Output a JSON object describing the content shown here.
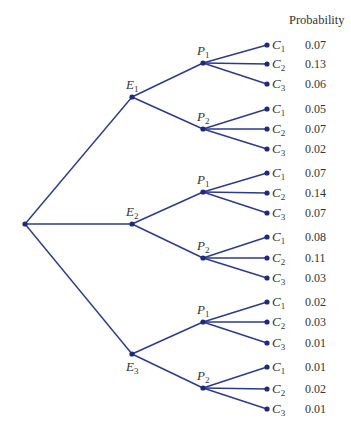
{
  "header": {
    "probability_label": "Probability"
  },
  "colors": {
    "edge": "#2b3a8c",
    "node": "#1f2a7a",
    "text": "#333333"
  },
  "tree": {
    "root": {
      "x": 25,
      "y": 224
    },
    "branches": [
      {
        "label": "E",
        "sub": "1",
        "x": 132,
        "y": 97,
        "label_pos": "above",
        "children": [
          {
            "label": "P",
            "sub": "1",
            "x": 203,
            "y": 63,
            "leaves": [
              {
                "label": "C",
                "sub": "1",
                "y": 45,
                "prob": "0.07"
              },
              {
                "label": "C",
                "sub": "2",
                "y": 64,
                "prob": "0.13"
              },
              {
                "label": "C",
                "sub": "3",
                "y": 84,
                "prob": "0.06"
              }
            ]
          },
          {
            "label": "P",
            "sub": "2",
            "x": 203,
            "y": 129,
            "leaves": [
              {
                "label": "C",
                "sub": "1",
                "y": 109,
                "prob": "0.05"
              },
              {
                "label": "C",
                "sub": "2",
                "y": 129,
                "prob": "0.07"
              },
              {
                "label": "C",
                "sub": "3",
                "y": 149,
                "prob": "0.02"
              }
            ]
          }
        ]
      },
      {
        "label": "E",
        "sub": "2",
        "x": 132,
        "y": 224,
        "label_pos": "above",
        "children": [
          {
            "label": "P",
            "sub": "1",
            "x": 203,
            "y": 192,
            "leaves": [
              {
                "label": "C",
                "sub": "1",
                "y": 173,
                "prob": "0.07"
              },
              {
                "label": "C",
                "sub": "2",
                "y": 193,
                "prob": "0.14"
              },
              {
                "label": "C",
                "sub": "3",
                "y": 213,
                "prob": "0.07"
              }
            ]
          },
          {
            "label": "P",
            "sub": "2",
            "x": 203,
            "y": 258,
            "leaves": [
              {
                "label": "C",
                "sub": "1",
                "y": 237,
                "prob": "0.08"
              },
              {
                "label": "C",
                "sub": "2",
                "y": 258,
                "prob": "0.11"
              },
              {
                "label": "C",
                "sub": "3",
                "y": 278,
                "prob": "0.03"
              }
            ]
          }
        ]
      },
      {
        "label": "E",
        "sub": "3",
        "x": 132,
        "y": 354,
        "label_pos": "below",
        "children": [
          {
            "label": "P",
            "sub": "1",
            "x": 203,
            "y": 322,
            "leaves": [
              {
                "label": "C",
                "sub": "1",
                "y": 302,
                "prob": "0.02"
              },
              {
                "label": "C",
                "sub": "2",
                "y": 322,
                "prob": "0.03"
              },
              {
                "label": "C",
                "sub": "3",
                "y": 343,
                "prob": "0.01"
              }
            ]
          },
          {
            "label": "P",
            "sub": "2",
            "x": 203,
            "y": 388,
            "leaves": [
              {
                "label": "C",
                "sub": "1",
                "y": 367,
                "prob": "0.01"
              },
              {
                "label": "C",
                "sub": "2",
                "y": 389,
                "prob": "0.02"
              },
              {
                "label": "C",
                "sub": "3",
                "y": 409,
                "prob": "0.01"
              }
            ]
          }
        ]
      }
    ]
  },
  "layout": {
    "leaf_x": 267,
    "prob_x": 305
  }
}
